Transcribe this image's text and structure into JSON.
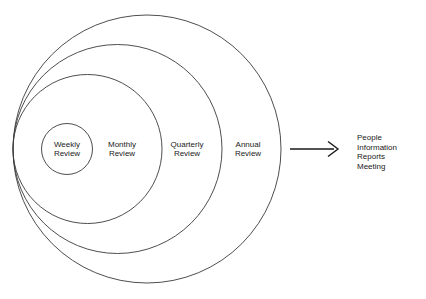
{
  "diagram": {
    "type": "concentric-circles-flow",
    "background_color": "#ffffff",
    "stroke_color": "#3a3a3a",
    "text_color": "#1a1a1a",
    "rings": [
      {
        "id": "annual",
        "label_line_1": "Annual",
        "label_line_2": "Review",
        "label_x": 248,
        "label_y": 149,
        "cx": 147,
        "cy": 149,
        "r": 134
      },
      {
        "id": "quarterly",
        "label_line_1": "Quarterly",
        "label_line_2": "Review",
        "label_x": 187,
        "label_y": 149,
        "cx": 117.5,
        "cy": 149,
        "r": 104.5
      },
      {
        "id": "monthly",
        "label_line_1": "Monthly",
        "label_line_2": "Review",
        "label_x": 122,
        "label_y": 149,
        "cx": 87.5,
        "cy": 149,
        "r": 74.5
      },
      {
        "id": "weekly",
        "label_line_1": "Weekly",
        "label_line_2": "Review",
        "label_x": 67,
        "label_y": 149,
        "cx": 67,
        "cy": 149,
        "r": 25.5
      }
    ],
    "arrow": {
      "x_start": 290,
      "x_end": 338,
      "y": 149
    },
    "outcomes": [
      "People",
      "Information",
      "Reports",
      "Meeting"
    ]
  }
}
